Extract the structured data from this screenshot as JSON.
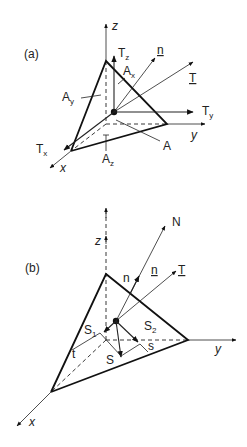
{
  "figure": {
    "panels": [
      {
        "id": "a",
        "label": "(a)",
        "axes": {
          "z": "z",
          "y": "y",
          "x": "x"
        },
        "vectors": {
          "Tz": {
            "main": "T",
            "sub": "z"
          },
          "Ty": {
            "main": "T",
            "sub": "y"
          },
          "Tx": {
            "main": "T",
            "sub": "x"
          },
          "n": "n",
          "T": "T"
        },
        "areas": {
          "Ax": {
            "main": "A",
            "sub": "x"
          },
          "Ay": {
            "main": "A",
            "sub": "y"
          },
          "Az": {
            "main": "A",
            "sub": "z"
          },
          "A": "A"
        }
      },
      {
        "id": "b",
        "label": "(b)",
        "axes": {
          "z": "z",
          "y": "y",
          "x": "x"
        },
        "vectors": {
          "N": "N",
          "n_plain": "n",
          "n_bold": "n",
          "T": "T",
          "S": "S",
          "S1": {
            "main": "S",
            "sub": "1"
          },
          "S2": {
            "main": "S",
            "sub": "2"
          },
          "s": "s",
          "t": "t"
        }
      }
    ]
  }
}
